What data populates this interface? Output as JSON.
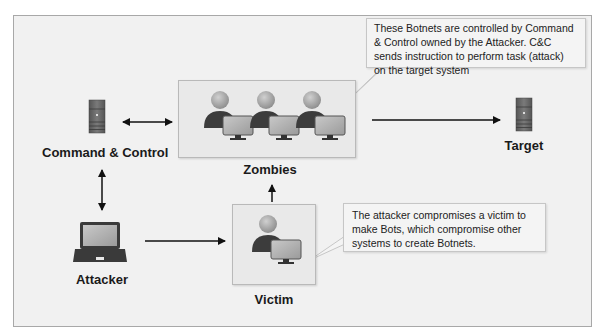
{
  "diagram": {
    "nodes": {
      "command_control": {
        "label": "Command & Control",
        "icon": "server-icon"
      },
      "zombies": {
        "label": "Zombies",
        "icon": "user-computer-icon",
        "count": 3
      },
      "target": {
        "label": "Target",
        "icon": "server-icon"
      },
      "attacker": {
        "label": "Attacker",
        "icon": "laptop-icon"
      },
      "victim": {
        "label": "Victim",
        "icon": "user-computer-icon"
      }
    },
    "callouts": {
      "zombies_note": "These Botnets are controlled by Command & Control owned by the Attacker. C&C sends instruction to perform task (attack) on the target system",
      "victim_note": "The attacker compromises a victim to make Bots, which compromise other systems to create Botnets."
    },
    "edges": [
      {
        "from": "command_control",
        "to": "zombies",
        "type": "bidirectional"
      },
      {
        "from": "zombies",
        "to": "target",
        "type": "directed"
      },
      {
        "from": "command_control",
        "to": "attacker",
        "type": "bidirectional"
      },
      {
        "from": "attacker",
        "to": "victim",
        "type": "directed"
      },
      {
        "from": "victim",
        "to": "zombies",
        "type": "directed"
      }
    ],
    "colors": {
      "background": "#f1f1f1",
      "box_fill": "#e9e9e9",
      "person_head": "#a8a8a8",
      "person_body": "#3c3c3c",
      "monitor_screen": "#b5b5b5",
      "server": "#6a6a6a"
    }
  }
}
